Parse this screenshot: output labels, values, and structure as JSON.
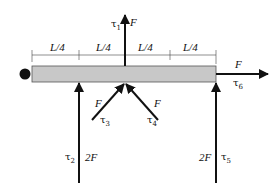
{
  "figure": {
    "dimension_labels": [
      "L/4",
      "L/4",
      "L/4",
      "L/4"
    ],
    "forces": [
      {
        "id": "tau1",
        "label": "F",
        "tau": "τ",
        "sub": "1",
        "direction": "up",
        "location": "midspan top"
      },
      {
        "id": "tau2",
        "label": "2F",
        "tau": "τ",
        "sub": "2",
        "direction": "up",
        "location": "L/4 from left"
      },
      {
        "id": "tau3",
        "label": "F",
        "tau": "τ",
        "sub": "3",
        "direction": "up-right diagonal",
        "location": "midspan bottom"
      },
      {
        "id": "tau4",
        "label": "F",
        "tau": "τ",
        "sub": "4",
        "direction": "up-left diagonal",
        "location": "midspan bottom"
      },
      {
        "id": "tau5",
        "label": "2F",
        "tau": "τ",
        "sub": "5",
        "direction": "up",
        "location": "right end"
      },
      {
        "id": "tau6",
        "label": "F",
        "tau": "τ",
        "sub": "6",
        "direction": "right",
        "location": "right end"
      }
    ],
    "colors": {
      "beam_fill": "#c8c8c8",
      "beam_stroke": "#555555",
      "ink": "#111111"
    }
  }
}
